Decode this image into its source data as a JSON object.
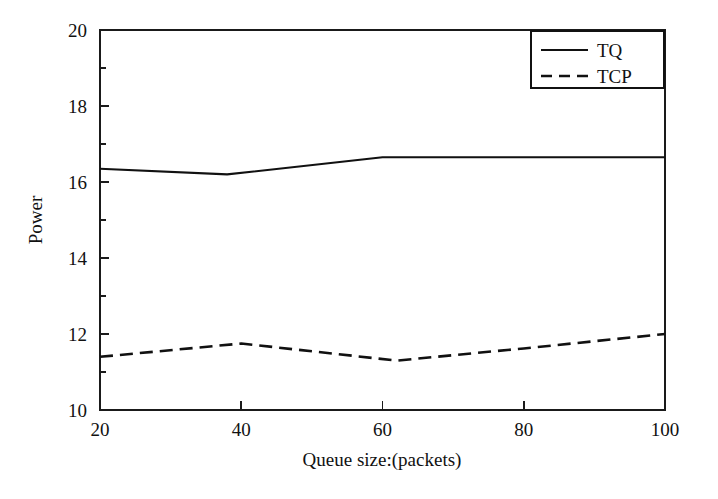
{
  "chart_data": {
    "type": "line",
    "title": "",
    "xlabel": "Queue size:(packets)",
    "ylabel": "Power",
    "xlim": [
      20,
      100
    ],
    "ylim": [
      10,
      20
    ],
    "xticks": [
      20,
      40,
      60,
      80,
      100
    ],
    "yticks": [
      10,
      12,
      14,
      16,
      18,
      20
    ],
    "xtick_labels": [
      "20",
      "40",
      "60",
      "80",
      "100"
    ],
    "ytick_labels": [
      "10",
      "12",
      "14",
      "16",
      "18",
      "20"
    ],
    "minor_yticks": [
      11,
      13,
      15,
      17,
      19
    ],
    "grid": false,
    "legend_position": "top-right",
    "legend_entries": [
      "TQ",
      "TCP"
    ],
    "series": [
      {
        "name": "TQ",
        "style": "solid",
        "color": "#111111",
        "x": [
          20,
          38,
          60,
          80,
          100
        ],
        "values": [
          16.35,
          16.2,
          16.65,
          16.65,
          16.65
        ]
      },
      {
        "name": "TCP",
        "style": "dashed",
        "color": "#111111",
        "x": [
          20,
          40,
          62,
          80,
          100
        ],
        "values": [
          11.4,
          11.75,
          11.3,
          11.62,
          12.0
        ]
      }
    ]
  },
  "figure": {
    "axis_color": "#111111",
    "background": "#ffffff"
  }
}
